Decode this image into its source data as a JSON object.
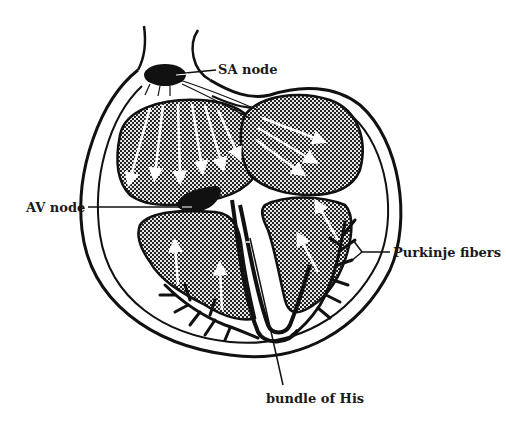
{
  "diagram": {
    "labels": {
      "sa_node": "SA node",
      "av_node": "AV node",
      "purkinje_fibers": "Purkinje fibers",
      "bundle_of_his": "bundle of His"
    },
    "colors": {
      "ink": "#111111",
      "background": "#ffffff",
      "chamber_fill": "#5a5a5a",
      "arrows": "#ffffff"
    }
  }
}
